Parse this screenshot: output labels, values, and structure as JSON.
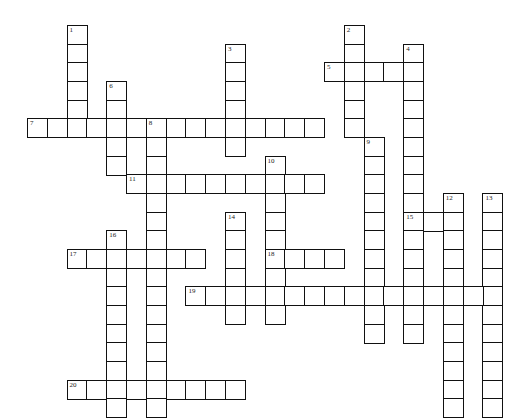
{
  "puzzle": {
    "type": "crossword",
    "grid": {
      "origin_x": 27,
      "origin_y": 25,
      "cell_width": 19.8,
      "cell_height": 18.67,
      "cols": 24,
      "rows": 21
    },
    "colors": {
      "background": "#ffffff",
      "border": "#111111",
      "number": "#222222"
    },
    "entries": [
      {
        "number": "1",
        "direction": "down",
        "row": 0,
        "col": 2,
        "length": 6
      },
      {
        "number": "2",
        "direction": "down",
        "row": 0,
        "col": 16,
        "length": 6
      },
      {
        "number": "3",
        "direction": "down",
        "row": 1,
        "col": 10,
        "length": 6
      },
      {
        "number": "4",
        "direction": "down",
        "row": 1,
        "col": 19,
        "length": 16
      },
      {
        "number": "5",
        "direction": "across",
        "row": 2,
        "col": 15,
        "length": 5
      },
      {
        "number": "6",
        "direction": "down",
        "row": 3,
        "col": 4,
        "length": 5
      },
      {
        "number": "7",
        "direction": "across",
        "row": 5,
        "col": 0,
        "length": 15
      },
      {
        "number": "8",
        "direction": "down",
        "row": 5,
        "col": 6,
        "length": 16
      },
      {
        "number": "9",
        "direction": "down",
        "row": 6,
        "col": 17,
        "length": 11
      },
      {
        "number": "10",
        "direction": "down",
        "row": 7,
        "col": 12,
        "length": 9
      },
      {
        "number": "11",
        "direction": "across",
        "row": 8,
        "col": 5,
        "length": 10
      },
      {
        "number": "12",
        "direction": "down",
        "row": 9,
        "col": 21,
        "length": 12
      },
      {
        "number": "13",
        "direction": "down",
        "row": 9,
        "col": 23,
        "length": 12
      },
      {
        "number": "14",
        "direction": "down",
        "row": 10,
        "col": 10,
        "length": 6
      },
      {
        "number": "15",
        "direction": "across",
        "row": 10,
        "col": 19,
        "length": 3
      },
      {
        "number": "16",
        "direction": "down",
        "row": 11,
        "col": 4,
        "length": 10
      },
      {
        "number": "17",
        "direction": "across",
        "row": 12,
        "col": 2,
        "length": 7
      },
      {
        "number": "18",
        "direction": "across",
        "row": 12,
        "col": 12,
        "length": 4
      },
      {
        "number": "19",
        "direction": "across",
        "row": 14,
        "col": 8,
        "length": 16
      },
      {
        "number": "20",
        "direction": "across",
        "row": 19,
        "col": 2,
        "length": 9
      }
    ]
  }
}
